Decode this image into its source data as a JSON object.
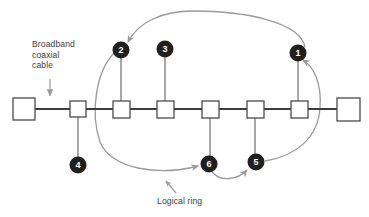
{
  "diagram": {
    "type": "network-topology",
    "colors": {
      "background": "#ffffff",
      "bus_line": "#3d3d3d",
      "station_outline": "#4a4a4a",
      "station_fill": "#ffffff",
      "stub_line": "#6e6e6e",
      "node_fill": "#221f1f",
      "node_text": "#ffffff",
      "ring_arc": "#9a9a9a",
      "label_text": "#3c3c3c",
      "pointer_arrow": "#9a9a9a"
    },
    "labels": {
      "cable": {
        "line1": "Broadband",
        "line2": "coaxial",
        "line3": "cable"
      },
      "ring": "Logical ring"
    },
    "bus": {
      "y": 109,
      "x_start": 13,
      "x_end": 360,
      "terminators": [
        {
          "name": "terminator-left",
          "x": 13,
          "y": 98,
          "size": 22
        },
        {
          "name": "terminator-right",
          "x": 337,
          "y": 98,
          "size": 23
        }
      ],
      "stations": [
        {
          "id": "station-a",
          "x": 70,
          "y": 101,
          "size": 16,
          "node": "4",
          "stub": "down"
        },
        {
          "id": "station-b",
          "x": 113,
          "y": 101,
          "size": 17,
          "node": "2",
          "stub": "up"
        },
        {
          "id": "station-c",
          "x": 157,
          "y": 101,
          "size": 17,
          "node": "3",
          "stub": "up"
        },
        {
          "id": "station-d",
          "x": 202,
          "y": 101,
          "size": 17,
          "node": "6",
          "stub": "down"
        },
        {
          "id": "station-e",
          "x": 247,
          "y": 101,
          "size": 17,
          "node": "5",
          "stub": "down"
        },
        {
          "id": "station-f",
          "x": 291,
          "y": 101,
          "size": 17,
          "node": "1",
          "stub": "up"
        }
      ]
    },
    "ring_nodes": [
      {
        "label": "1",
        "cx": 298,
        "cy": 53,
        "r": 8.5
      },
      {
        "label": "2",
        "cx": 121,
        "cy": 50,
        "r": 8.5
      },
      {
        "label": "3",
        "cx": 165,
        "cy": 49,
        "r": 8.5
      },
      {
        "label": "4",
        "cx": 74,
        "cy": 165,
        "r": 8.5
      },
      {
        "label": "5",
        "cx": 256,
        "cy": 162,
        "r": 8.5
      },
      {
        "label": "6",
        "cx": 208,
        "cy": 164,
        "r": 8.5
      }
    ],
    "ring_order": [
      "1",
      "2",
      "6",
      "5",
      "1"
    ],
    "ring_arcs": [
      {
        "from": "1",
        "to": "2",
        "position": "top"
      },
      {
        "from": "2",
        "to": "6",
        "position": "left"
      },
      {
        "from": "6",
        "to": "5",
        "position": "bottom"
      },
      {
        "from": "5",
        "to": "1",
        "position": "right"
      }
    ]
  }
}
